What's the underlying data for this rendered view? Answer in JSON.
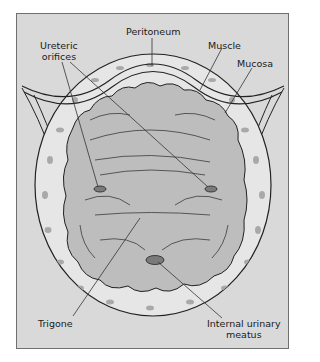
{
  "figure": {
    "colors": {
      "background": "#d9d9d9",
      "muscle_layer": "#e6e6e6",
      "muscle_spots": "#a9a9a9",
      "mucosa": "#bdbdbd",
      "outline": "#222222",
      "orifice": "#7a7a7a"
    }
  },
  "labels": {
    "peritoneum": "Peritoneum",
    "ureteric_line1": "Ureteric",
    "ureteric_line2": "orifices",
    "muscle": "Muscle",
    "mucosa": "Mucosa",
    "trigone": "Trigone",
    "meatus_line1": "Internal urinary",
    "meatus_line2": "meatus"
  }
}
